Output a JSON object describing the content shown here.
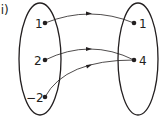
{
  "label": "(i)",
  "domain_set": {
    "elements": [
      "1",
      "2",
      "−2"
    ]
  },
  "codomain_set": {
    "elements": [
      "1",
      "4"
    ]
  },
  "mappings": [
    {
      "from": "1",
      "to": "1"
    },
    {
      "from": "2",
      "to": "4"
    },
    {
      "from": "−2",
      "to": "4"
    }
  ],
  "colors": {
    "stroke": "#231f20",
    "background": "#ffffff"
  }
}
